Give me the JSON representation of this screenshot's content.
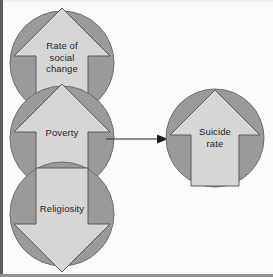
{
  "figure": {
    "type": "causal-path-diagram",
    "background_color": "#fbfbfa",
    "circle_color": "#9a9a9a",
    "circle_stroke": "#6e6e6e",
    "arrow_fill": "#d6d6d6",
    "arrow_stroke": "#5a5a5a",
    "connector_color": "#262626",
    "text_color": "#262626"
  },
  "nodes": [
    {
      "id": "rate-of-social-change",
      "name": "rate-of-social-change",
      "label": "Rate of\nsocial\nchange",
      "label_lines": [
        "Rate of",
        "social",
        "change"
      ],
      "direction": "up",
      "cx": 62,
      "cy": 63,
      "r": 52
    },
    {
      "id": "poverty",
      "name": "poverty",
      "label": "Poverty",
      "label_lines": [
        "Poverty"
      ],
      "direction": "up",
      "cx": 62,
      "cy": 138,
      "r": 52
    },
    {
      "id": "religiosity",
      "name": "religiosity",
      "label": "Religiosity",
      "label_lines": [
        "Religiosity"
      ],
      "direction": "down",
      "cx": 62,
      "cy": 214,
      "r": 52
    },
    {
      "id": "suicide-rate",
      "name": "suicide-rate",
      "label": "Suicide\nrate",
      "label_lines": [
        "Suicide",
        "rate"
      ],
      "direction": "up",
      "cx": 215,
      "cy": 138,
      "r": 49
    }
  ],
  "connector": {
    "name": "poverty-to-suicide-rate-arrow",
    "from": "poverty",
    "to": "suicide-rate",
    "x1": 106,
    "y1": 139,
    "x2": 168,
    "y2": 139,
    "head": "solid-triangle"
  }
}
